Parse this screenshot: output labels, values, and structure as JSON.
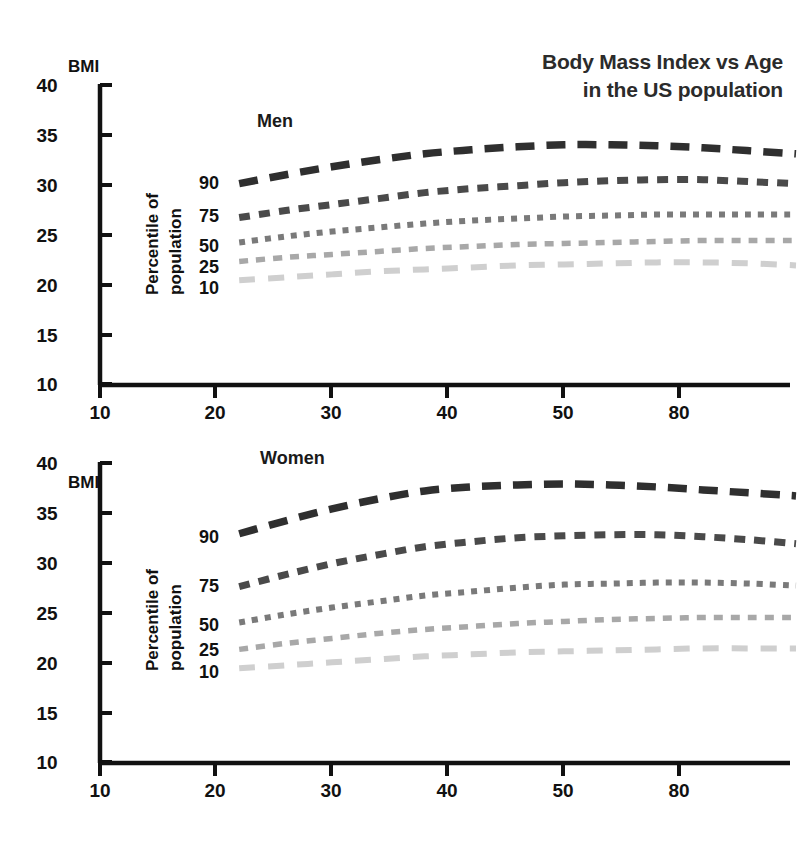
{
  "title": {
    "line1": "Body Mass Index vs Age",
    "line2": "in the US population"
  },
  "axis": {
    "y_name": "BMI",
    "rot_label_line1": "Percentile of",
    "rot_label_line2": "population",
    "y_ticks": [
      "40",
      "35",
      "30",
      "25",
      "20",
      "15",
      "10"
    ],
    "x_ticks": [
      "10",
      "20",
      "30",
      "40",
      "50",
      "80"
    ]
  },
  "panels": {
    "men_label": "Men",
    "women_label": "Women"
  },
  "series_labels": {
    "p90": "90",
    "p75": "75",
    "p50": "50",
    "p25": "25",
    "p10": "10"
  },
  "colors": {
    "p90": "#2f2f2f",
    "p75": "#4a4a4a",
    "p50": "#7a7a7a",
    "p25": "#a8a8a8",
    "p10": "#cfcfcf",
    "axis": "#111111",
    "title": "#2b2b2b"
  },
  "chart_data": [
    {
      "type": "line",
      "title": "Body Mass Index vs Age in the US population",
      "subtitle": "Men",
      "xlabel": "Age (years)",
      "ylabel": "BMI",
      "xlim": [
        10,
        70
      ],
      "ylim": [
        10,
        40
      ],
      "xticks": [
        10,
        20,
        30,
        40,
        50,
        60
      ],
      "xticklabels": [
        "10",
        "20",
        "30",
        "40",
        "50",
        "80"
      ],
      "yticks": [
        10,
        15,
        20,
        25,
        30,
        35,
        40
      ],
      "grid": false,
      "legend": "inline-left-labels",
      "x": [
        22,
        26,
        30,
        34,
        38,
        42,
        46,
        50,
        54,
        58,
        62,
        66,
        70
      ],
      "series": [
        {
          "name": "90",
          "dash": "long-dash",
          "values": [
            30.1,
            31.0,
            31.8,
            32.5,
            33.1,
            33.5,
            33.8,
            34.0,
            34.0,
            33.9,
            33.7,
            33.4,
            33.1
          ]
        },
        {
          "name": "75",
          "dash": "medium-dash",
          "values": [
            26.7,
            27.4,
            28.0,
            28.6,
            29.2,
            29.6,
            29.9,
            30.2,
            30.4,
            30.5,
            30.5,
            30.3,
            30.1
          ]
        },
        {
          "name": "50",
          "dash": "dotted",
          "values": [
            24.2,
            24.8,
            25.3,
            25.7,
            26.1,
            26.4,
            26.6,
            26.8,
            26.9,
            27.0,
            27.0,
            27.0,
            27.0
          ]
        },
        {
          "name": "25",
          "dash": "short-dash",
          "values": [
            22.3,
            22.7,
            23.0,
            23.3,
            23.6,
            23.8,
            24.0,
            24.1,
            24.2,
            24.3,
            24.4,
            24.4,
            24.4
          ]
        },
        {
          "name": "10",
          "dash": "long-dash-light",
          "values": [
            20.4,
            20.7,
            21.0,
            21.3,
            21.5,
            21.7,
            21.9,
            22.0,
            22.1,
            22.2,
            22.2,
            22.1,
            21.9
          ]
        }
      ]
    },
    {
      "type": "line",
      "title": "Body Mass Index vs Age in the US population",
      "subtitle": "Women",
      "xlabel": "Age (years)",
      "ylabel": "BMI",
      "xlim": [
        10,
        70
      ],
      "ylim": [
        10,
        40
      ],
      "xticks": [
        10,
        20,
        30,
        40,
        50,
        60
      ],
      "xticklabels": [
        "10",
        "20",
        "30",
        "40",
        "50",
        "80"
      ],
      "yticks": [
        10,
        15,
        20,
        25,
        30,
        35,
        40
      ],
      "grid": false,
      "legend": "inline-left-labels",
      "x": [
        22,
        26,
        30,
        34,
        38,
        42,
        46,
        50,
        54,
        58,
        62,
        66,
        70
      ],
      "series": [
        {
          "name": "90",
          "dash": "long-dash",
          "values": [
            32.9,
            34.2,
            35.4,
            36.4,
            37.2,
            37.6,
            37.8,
            37.9,
            37.8,
            37.6,
            37.3,
            37.0,
            36.7
          ]
        },
        {
          "name": "75",
          "dash": "medium-dash",
          "values": [
            27.6,
            28.8,
            29.9,
            30.8,
            31.6,
            32.1,
            32.5,
            32.7,
            32.8,
            32.8,
            32.6,
            32.3,
            31.9
          ]
        },
        {
          "name": "50",
          "dash": "dotted",
          "values": [
            24.0,
            24.8,
            25.5,
            26.1,
            26.7,
            27.1,
            27.5,
            27.8,
            27.9,
            28.0,
            28.0,
            27.9,
            27.7
          ]
        },
        {
          "name": "25",
          "dash": "short-dash",
          "values": [
            21.3,
            21.9,
            22.4,
            22.9,
            23.3,
            23.6,
            23.9,
            24.1,
            24.3,
            24.4,
            24.5,
            24.5,
            24.5
          ]
        },
        {
          "name": "10",
          "dash": "long-dash-light",
          "values": [
            19.4,
            19.7,
            20.0,
            20.3,
            20.6,
            20.8,
            21.0,
            21.1,
            21.2,
            21.3,
            21.4,
            21.4,
            21.4
          ]
        }
      ]
    }
  ]
}
